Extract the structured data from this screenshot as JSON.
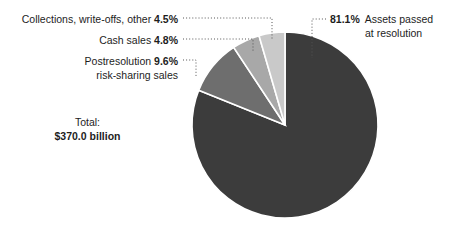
{
  "chart_data": {
    "type": "pie",
    "title": "",
    "subtitle": "",
    "xlabel": "",
    "ylabel": "",
    "legend_position": "callout-labels",
    "grid": false,
    "total_label": "Total:",
    "total_value": "$370.0 billion",
    "units": "percent of total",
    "categories": [
      "Assets passed at resolution",
      "Collections, write-offs, other",
      "Cash sales",
      "Postresolution risk-sharing sales"
    ],
    "values": [
      81.1,
      4.5,
      4.8,
      9.6
    ],
    "value_labels": [
      "81.1%",
      "4.5%",
      "4.8%",
      "9.6%"
    ],
    "colors": [
      "#3c3c3c",
      "#c9c9c9",
      "#a8a8a8",
      "#6e6e6e"
    ],
    "slice_order_clockwise_from_top": [
      {
        "name": "Assets passed at resolution",
        "value": 81.1,
        "color": "#3c3c3c"
      },
      {
        "name": "Postresolution risk-sharing sales",
        "value": 9.6,
        "color": "#6e6e6e"
      },
      {
        "name": "Cash sales",
        "value": 4.8,
        "color": "#a8a8a8"
      },
      {
        "name": "Collections, write-offs, other",
        "value": 4.5,
        "color": "#c9c9c9"
      }
    ]
  },
  "labels": {
    "collections": {
      "text": "Collections, write-offs, other",
      "pct": "4.5%"
    },
    "cash_sales": {
      "text": "Cash sales",
      "pct": "4.8%"
    },
    "postresolution": {
      "line1": "Postresolution",
      "line2": "risk-sharing sales",
      "pct": "9.6%"
    },
    "assets_passed": {
      "pct": "81.1%",
      "line1": "Assets passed",
      "line2": "at resolution"
    },
    "total": {
      "caption": "Total:",
      "amount": "$370.0 billion"
    }
  },
  "style": {
    "background": "#ffffff",
    "text_color": "#1d1d1d",
    "leader_line_color": "#555555",
    "slice_separator_color": "#ffffff"
  }
}
